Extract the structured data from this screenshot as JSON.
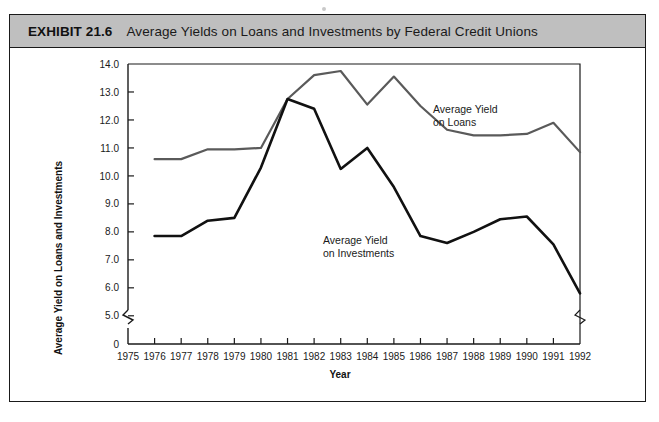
{
  "exhibit": {
    "label": "EXHIBIT 21.6",
    "title": "Average Yields on Loans and Investments by Federal Credit Unions",
    "header_bg": "#bfbfbf",
    "border_color": "#1a1a1a"
  },
  "annotations": {
    "loans_line1": "Average Yield",
    "loans_line2": "on Loans",
    "investments_line1": "Average Yield",
    "investments_line2": "on Investments"
  },
  "axis": {
    "y_title": "Average Yield on Loans and Investments",
    "x_title": "Year",
    "y_ticks": [
      "0",
      "5.0",
      "6.0",
      "7.0",
      "8.0",
      "9.0",
      "10.0",
      "11.0",
      "12.0",
      "13.0",
      "14.0"
    ],
    "x_ticks": [
      "1975",
      "1976",
      "1977",
      "1978",
      "1979",
      "1980",
      "1981",
      "1982",
      "1983",
      "1984",
      "1985",
      "1986",
      "1987",
      "1988",
      "1989",
      "1990",
      "1991",
      "1992"
    ],
    "y_break_label": "axis-break"
  },
  "chart_data": {
    "type": "line",
    "title": "Average Yields on Loans and Investments by Federal Credit Unions",
    "xlabel": "Year",
    "ylabel": "Average Yield on Loans and Investments",
    "x": [
      1975,
      1976,
      1977,
      1978,
      1979,
      1980,
      1981,
      1982,
      1983,
      1984,
      1985,
      1986,
      1987,
      1988,
      1989,
      1990,
      1991,
      1992
    ],
    "xlim": [
      1975,
      1992
    ],
    "ylim": [
      4.6,
      14.0
    ],
    "y_axis_break": true,
    "y_tick_values": [
      5.0,
      6.0,
      7.0,
      8.0,
      9.0,
      10.0,
      11.0,
      12.0,
      13.0,
      14.0
    ],
    "grid": false,
    "legend": "annotated-inline",
    "series": [
      {
        "name": "Average Yield on Loans",
        "color": "#5a5a5a",
        "x": [
          1976,
          1977,
          1978,
          1979,
          1980,
          1981,
          1982,
          1983,
          1984,
          1985,
          1986,
          1987,
          1988,
          1989,
          1990,
          1991,
          1992
        ],
        "values": [
          10.6,
          10.6,
          10.95,
          10.95,
          11.0,
          12.75,
          13.6,
          13.75,
          12.55,
          13.55,
          12.5,
          11.65,
          11.45,
          11.45,
          11.5,
          11.9,
          10.85
        ]
      },
      {
        "name": "Average Yield on Investments",
        "color": "#111111",
        "x": [
          1976,
          1977,
          1978,
          1979,
          1980,
          1981,
          1982,
          1983,
          1984,
          1985,
          1986,
          1987,
          1988,
          1989,
          1990,
          1991,
          1992
        ],
        "values": [
          7.85,
          7.85,
          8.4,
          8.5,
          10.3,
          12.75,
          12.4,
          10.25,
          11.0,
          9.6,
          7.85,
          7.6,
          8.0,
          8.45,
          8.55,
          7.55,
          5.8
        ]
      }
    ]
  }
}
